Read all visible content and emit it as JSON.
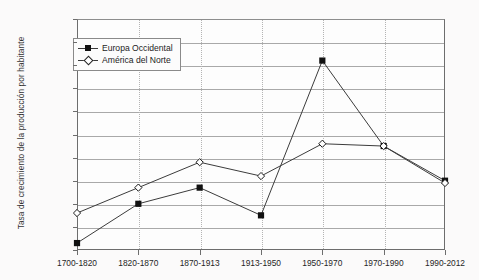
{
  "chart_data": {
    "type": "line",
    "title": "",
    "xlabel": "",
    "ylabel": "Tasa de crecimiento de la producción por habitante",
    "categories": [
      "1700-1820",
      "1820-1870",
      "1870-1913",
      "1913-1950",
      "1950-1970",
      "1970-1990",
      "1990-2012"
    ],
    "ylim": [
      0.0,
      5.0
    ],
    "ytick_labels": [
      "0.0%",
      "0.5%",
      "1.0%",
      "1.5%",
      "2.0%",
      "2.5%",
      "3.0%",
      "3.5%",
      "4.0%",
      "4.5%",
      "5.0%"
    ],
    "ytick_values": [
      0.0,
      0.5,
      1.0,
      1.5,
      2.0,
      2.5,
      3.0,
      3.5,
      4.0,
      4.5,
      5.0
    ],
    "grid": "horizontal-solid-and-vertical-dotted",
    "legend_position": "top-left-inside",
    "series": [
      {
        "name": "Europa Occidental",
        "marker": "filled-square",
        "values": [
          0.15,
          1.0,
          1.35,
          0.75,
          4.1,
          2.25,
          1.5
        ]
      },
      {
        "name": "América del Norte",
        "marker": "open-diamond",
        "values": [
          0.8,
          1.35,
          1.9,
          1.6,
          2.3,
          2.25,
          1.45
        ]
      }
    ]
  },
  "legend": {
    "items": [
      {
        "label": "Europa Occidental",
        "marker": "filled-square"
      },
      {
        "label": "América del Norte",
        "marker": "open-diamond"
      }
    ]
  },
  "colors": {
    "background": "#fbfafa",
    "plot_background": "#fdfdfd",
    "axis": "#6d6d6d",
    "gridline": "#a9a9a9",
    "vertical_gridline": "#b4b4b4",
    "series_line": "#3c3c3c",
    "marker_fill": "#111111",
    "marker_open_fill": "#ffffff"
  }
}
